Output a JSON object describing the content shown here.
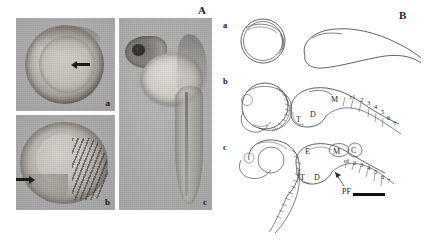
{
  "figure": {
    "panels": [
      {
        "id": "A",
        "label": "A"
      },
      {
        "id": "B",
        "label": "B"
      }
    ],
    "panelA": {
      "label": "A",
      "images": [
        {
          "name": "micrograph-a",
          "letter": "a",
          "description": "spherical embryo in chorion with arrow"
        },
        {
          "name": "micrograph-b",
          "letter": "b",
          "description": "curved embryo with somites and arrow"
        },
        {
          "name": "micrograph-c",
          "letter": "c",
          "description": "hatched larva with yolk sac and tail"
        }
      ]
    },
    "panelB": {
      "label": "B",
      "rows": [
        {
          "letter": "a",
          "annotations": []
        },
        {
          "letter": "b",
          "annotations": [
            "T",
            "D",
            "M",
            "r1",
            "2",
            "3",
            "4",
            "5",
            "6",
            "7"
          ]
        },
        {
          "letter": "c",
          "annotations": [
            "E",
            "M",
            "C",
            "T",
            "D",
            "PF",
            "r1",
            "2",
            "3",
            "4",
            "5",
            "6",
            "7"
          ]
        }
      ],
      "labels": {
        "T": "T",
        "D": "D",
        "M": "M",
        "E": "E",
        "C": "C",
        "PF": "PF",
        "r1": "r1",
        "r2": "2",
        "r3": "3",
        "r4": "4",
        "r5": "5",
        "r6": "6",
        "r7": "7"
      },
      "scalebar": {
        "name": "scale-bar"
      }
    },
    "caption": ""
  },
  "colors": {
    "background": "#ffffff",
    "photo_gray": "#a8a8a8",
    "ink": "#1b1b1b",
    "line": "#3a3a3a"
  }
}
